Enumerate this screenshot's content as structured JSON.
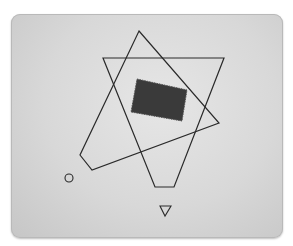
{
  "diagram": {
    "background": {
      "panel_color": "#d9d9d9",
      "page_color": "#ffffff"
    },
    "stroke_color": "#2a2a2a",
    "fill_color": "#3a3a3a",
    "shapes": [
      {
        "id": "quadrilateral",
        "type": "polygon",
        "points": "139,31 219,123 92,170 80,155",
        "filled": false
      },
      {
        "id": "truncated-inverted-triangle",
        "type": "polygon",
        "points": "103,58 224,58 174,187 155,187",
        "filled": false
      },
      {
        "id": "dark-rectangle",
        "type": "polygon",
        "points": "137,79 187,90 182,121 131,112",
        "filled": true
      },
      {
        "id": "small-circle",
        "type": "circle",
        "cx": 69,
        "cy": 178,
        "r": 4,
        "filled": false
      },
      {
        "id": "small-down-triangle",
        "type": "polygon",
        "points": "160,206 171,206 165,216",
        "filled": false
      }
    ]
  }
}
